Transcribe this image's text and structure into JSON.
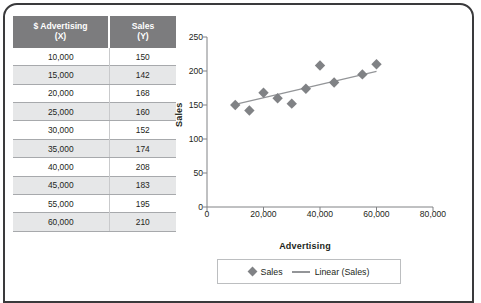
{
  "table": {
    "headers": [
      {
        "main": "$ Advertising",
        "sub": "(X)"
      },
      {
        "main": "Sales",
        "sub": "(Y)"
      }
    ],
    "rows": [
      {
        "x": "10,000",
        "y": "150"
      },
      {
        "x": "15,000",
        "y": "142"
      },
      {
        "x": "20,000",
        "y": "168"
      },
      {
        "x": "25,000",
        "y": "160"
      },
      {
        "x": "30,000",
        "y": "152"
      },
      {
        "x": "35,000",
        "y": "174"
      },
      {
        "x": "40,000",
        "y": "208"
      },
      {
        "x": "45,000",
        "y": "183"
      },
      {
        "x": "55,000",
        "y": "195"
      },
      {
        "x": "60,000",
        "y": "210"
      }
    ]
  },
  "chart_data": {
    "type": "scatter",
    "title": "",
    "xlabel": "Advertising",
    "ylabel": "Sales",
    "xlim": [
      0,
      80000
    ],
    "ylim": [
      0,
      250
    ],
    "xticks": [
      "0",
      "20,000",
      "40,000",
      "60,000",
      "80,000"
    ],
    "xtick_values": [
      0,
      20000,
      40000,
      60000,
      80000
    ],
    "yticks": [
      "0",
      "50",
      "100",
      "150",
      "200",
      "250"
    ],
    "ytick_values": [
      0,
      50,
      100,
      150,
      200,
      250
    ],
    "grid": false,
    "legend_position": "bottom",
    "legend": [
      {
        "label": "Sales",
        "marker": "diamond",
        "color": "#808285"
      },
      {
        "label": "Linear (Sales)",
        "marker": "line",
        "color": "#939598"
      }
    ],
    "series": [
      {
        "name": "Sales",
        "marker": "diamond",
        "color": "#808285",
        "x": [
          10000,
          15000,
          20000,
          25000,
          30000,
          35000,
          40000,
          45000,
          55000,
          60000
        ],
        "y": [
          150,
          142,
          168,
          160,
          152,
          174,
          208,
          183,
          195,
          210
        ]
      },
      {
        "name": "Linear (Sales)",
        "type": "trendline",
        "color": "#939598",
        "x": [
          10000,
          60000
        ],
        "y": [
          151.0,
          199.5
        ]
      }
    ]
  },
  "colors": {
    "header_bg": "#7c7c7e",
    "row_alt_bg": "#e6e7e8",
    "marker": "#808285",
    "trendline": "#939598",
    "border": "#3a3a3c"
  }
}
